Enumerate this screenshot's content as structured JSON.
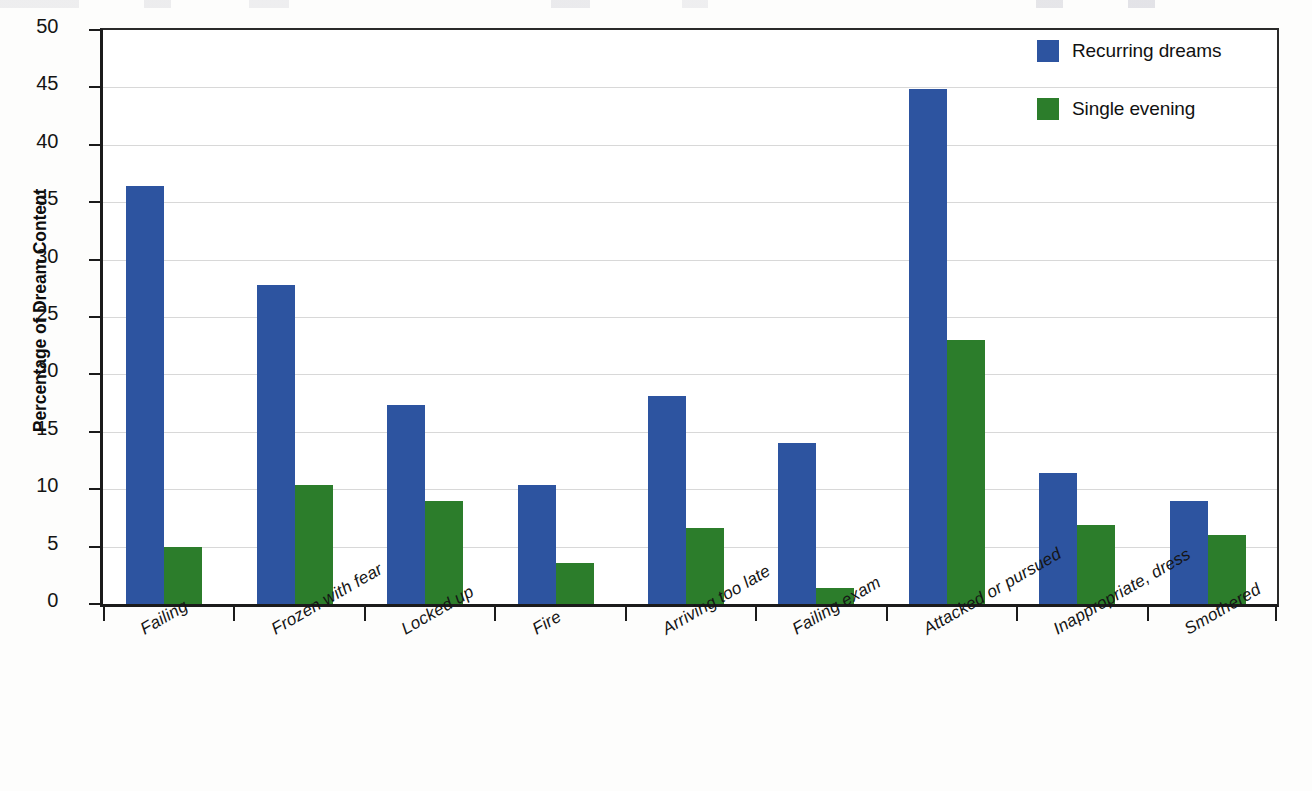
{
  "chart_data": {
    "type": "bar",
    "title": "",
    "subtitle": "",
    "xlabel": "",
    "ylabel": "Percentage of Dream Content",
    "ylim": [
      0,
      50
    ],
    "ytick_step": 5,
    "yticks": [
      "50",
      "45",
      "40",
      "35",
      "30",
      "25",
      "20",
      "15",
      "10",
      "5",
      "0"
    ],
    "grid": true,
    "legend_position": "top-right",
    "categories": [
      "Failing",
      "Frozen with fear",
      "Locked up",
      "Fire",
      "Arriving too late",
      "Failing exam",
      "Attacked or pursued",
      "Inappropriate, dress",
      "Smothered"
    ],
    "series": [
      {
        "name": "Recurring dreams",
        "color": "#2d54a0",
        "values": [
          36.4,
          27.8,
          17.3,
          10.4,
          18.1,
          14.0,
          44.9,
          11.4,
          9.0
        ]
      },
      {
        "name": "Single evening",
        "color": "#2c7d2b",
        "values": [
          5.0,
          10.4,
          9.0,
          3.6,
          6.6,
          1.4,
          23.0,
          6.9,
          6.0
        ]
      }
    ]
  },
  "axis": {
    "y_title": "Percentage of Dream Content"
  },
  "legend": {
    "items": [
      {
        "label": "Recurring dreams",
        "color": "#2d54a0"
      },
      {
        "label": "Single evening",
        "color": "#2c7d2b"
      }
    ]
  },
  "colors": {
    "series_blue": "#2d54a0",
    "series_green": "#2c7d2b",
    "gridline": "#d8d8d8",
    "axis": "#1b1b1b",
    "background": "#ffffff"
  }
}
